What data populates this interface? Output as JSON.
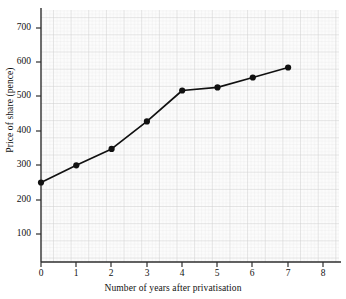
{
  "chart_data": {
    "type": "line",
    "title": "",
    "xlabel": "Number of years after privatisation",
    "ylabel": "Price of share (pence)",
    "x": [
      0,
      1,
      2,
      3,
      4,
      5,
      6,
      7
    ],
    "values": [
      250,
      300,
      348,
      428,
      518,
      527,
      556,
      585
    ],
    "series": [
      {
        "name": "Price of share",
        "x": [
          0,
          1,
          2,
          3,
          4,
          5,
          6,
          7
        ],
        "values": [
          250,
          300,
          348,
          428,
          518,
          527,
          556,
          585
        ]
      }
    ],
    "xlim": [
      0,
      8.5
    ],
    "ylim": [
      0,
      760
    ],
    "xticks": [
      0,
      1,
      2,
      3,
      4,
      5,
      6,
      7,
      8
    ],
    "yticks": [
      100,
      200,
      300,
      400,
      500,
      600,
      700
    ],
    "xtick_labels": [
      "0",
      "1",
      "2",
      "3",
      "4",
      "5",
      "6",
      "7",
      "8"
    ],
    "ytick_labels": [
      "100",
      "200",
      "300",
      "400",
      "500",
      "600",
      "700"
    ],
    "grid": true,
    "minor_grid": true,
    "legend": false,
    "marker": "filled-circle",
    "line_color": "#111111",
    "marker_color": "#111111",
    "grid_color": "#cfcfcf",
    "minor_grid_color": "#e7e7e7",
    "axis_color": "#3a3a3a",
    "plot_background": "#fbfbfb"
  },
  "axes": {
    "x_axis_label": "Number of years after privatisation",
    "y_axis_label": "Price of share (pence)"
  }
}
